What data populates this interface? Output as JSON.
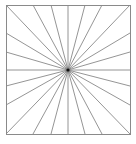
{
  "diagram": {
    "type": "starburst",
    "stroke_color": "#7a7a7a",
    "frame_color": "#8a8a8a",
    "center_color": "#111111",
    "background": "#ffffff",
    "frame": {
      "x1": 6,
      "y1": 5,
      "x2": 130,
      "y2": 134
    },
    "center": {
      "x": 68,
      "y": 70
    },
    "ray_count": 24,
    "endpoints": [
      [
        6,
        5
      ],
      [
        33,
        5
      ],
      [
        51,
        5
      ],
      [
        68,
        5
      ],
      [
        85,
        5
      ],
      [
        102,
        5
      ],
      [
        130,
        5
      ],
      [
        130,
        33
      ],
      [
        130,
        52
      ],
      [
        130,
        70
      ],
      [
        130,
        86
      ],
      [
        130,
        105
      ],
      [
        130,
        134
      ],
      [
        102,
        134
      ],
      [
        85,
        134
      ],
      [
        68,
        134
      ],
      [
        51,
        134
      ],
      [
        33,
        134
      ],
      [
        6,
        134
      ],
      [
        6,
        105
      ],
      [
        6,
        86
      ],
      [
        6,
        70
      ],
      [
        6,
        52
      ],
      [
        6,
        33
      ]
    ]
  }
}
